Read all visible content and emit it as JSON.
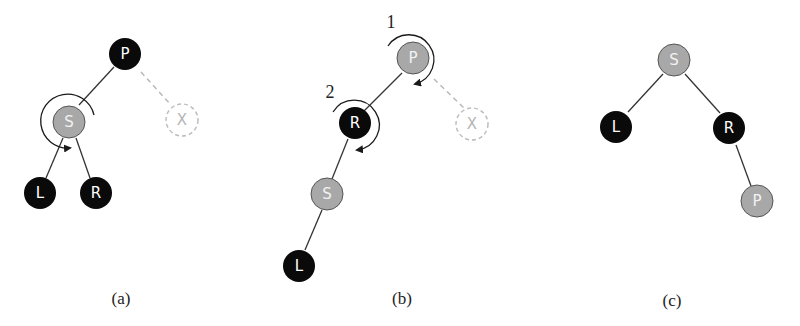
{
  "colors": {
    "black_node": "#0a0a0a",
    "red_node": "#a8a8a8",
    "ghost_node": "#bdbdbd",
    "edge": "#333333",
    "ghost_edge": "#b8b8b8",
    "label_on_dark": "#ffffff",
    "label_on_grey": "#f2f2f2"
  },
  "panels": [
    {
      "caption": "(a)",
      "nodes": [
        {
          "id": "P",
          "label": "P",
          "color": "black"
        },
        {
          "id": "S",
          "label": "S",
          "color": "grey"
        },
        {
          "id": "X",
          "label": "X",
          "color": "ghost"
        },
        {
          "id": "L",
          "label": "L",
          "color": "black"
        },
        {
          "id": "R",
          "label": "R",
          "color": "black"
        }
      ],
      "edges": [
        [
          "P",
          "S"
        ],
        [
          "P",
          "X",
          "dashed"
        ],
        [
          "S",
          "L"
        ],
        [
          "S",
          "R"
        ]
      ],
      "rotations": [
        {
          "around": "S",
          "direction": "counterclockwise"
        }
      ]
    },
    {
      "caption": "(b)",
      "nodes": [
        {
          "id": "P",
          "label": "P",
          "color": "grey"
        },
        {
          "id": "R",
          "label": "R",
          "color": "black"
        },
        {
          "id": "X",
          "label": "X",
          "color": "ghost"
        },
        {
          "id": "S",
          "label": "S",
          "color": "grey"
        },
        {
          "id": "L",
          "label": "L",
          "color": "black"
        }
      ],
      "edges": [
        [
          "P",
          "R"
        ],
        [
          "P",
          "X",
          "dashed"
        ],
        [
          "R",
          "S"
        ],
        [
          "S",
          "L"
        ]
      ],
      "rotations": [
        {
          "step": "1",
          "around": "P",
          "direction": "clockwise"
        },
        {
          "step": "2",
          "around": "R",
          "direction": "clockwise"
        }
      ]
    },
    {
      "caption": "(c)",
      "nodes": [
        {
          "id": "S",
          "label": "S",
          "color": "grey"
        },
        {
          "id": "L",
          "label": "L",
          "color": "black"
        },
        {
          "id": "R",
          "label": "R",
          "color": "black"
        },
        {
          "id": "P",
          "label": "P",
          "color": "grey"
        }
      ],
      "edges": [
        [
          "S",
          "L"
        ],
        [
          "S",
          "R"
        ],
        [
          "R",
          "P"
        ]
      ],
      "rotations": []
    }
  ]
}
